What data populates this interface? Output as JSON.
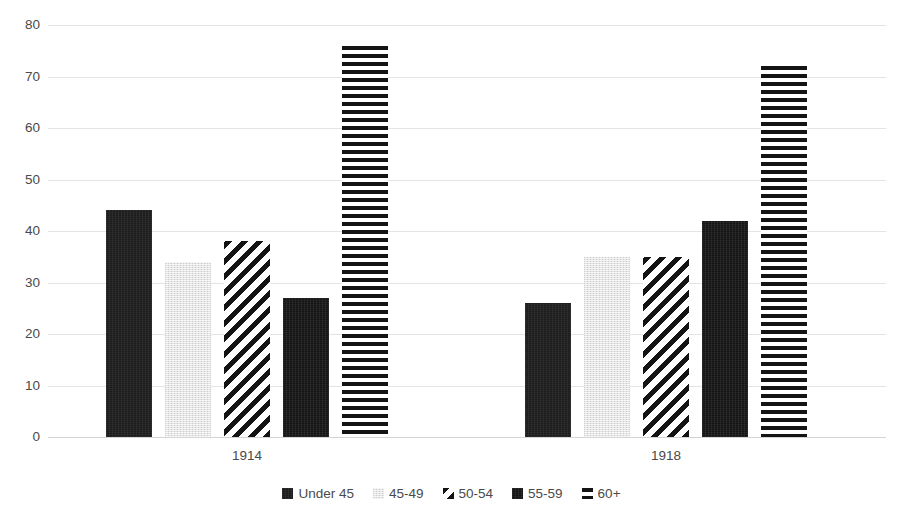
{
  "chart_data": {
    "type": "bar",
    "title": "",
    "subtitle": "",
    "xlabel": "",
    "ylabel": "",
    "categories": [
      "1914",
      "1918"
    ],
    "series": [
      {
        "name": "Under 45",
        "values": [
          44,
          26
        ],
        "pattern": "solid-dark",
        "color": "#1c1c1c"
      },
      {
        "name": "45-49",
        "values": [
          34,
          35
        ],
        "pattern": "light-gray",
        "color": "#e4e4e4"
      },
      {
        "name": "50-54",
        "values": [
          38,
          35
        ],
        "pattern": "diag-stripe",
        "color": "#141414"
      },
      {
        "name": "55-59",
        "values": [
          27,
          42
        ],
        "pattern": "solid-darker",
        "color": "#141414"
      },
      {
        "name": "60+",
        "values": [
          76,
          72
        ],
        "pattern": "horiz-stripe",
        "color": "#141414"
      }
    ],
    "ylim": [
      0,
      80
    ],
    "y_ticks": [
      0,
      10,
      20,
      30,
      40,
      50,
      60,
      70,
      80
    ],
    "y_tick_labels": [
      "0",
      "10",
      "20",
      "30",
      "40",
      "50",
      "60",
      "70",
      "80"
    ],
    "grid": true,
    "legend_position": "bottom",
    "annotations": []
  },
  "colors": {
    "gridline": "#e4e4e4",
    "axis_text": "#4a4a4a",
    "background": "#ffffff"
  }
}
